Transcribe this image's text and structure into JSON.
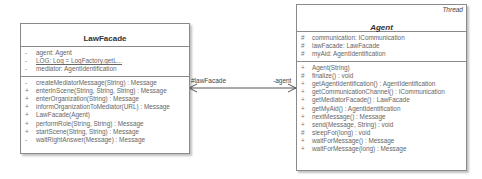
{
  "classes": {
    "lawfacade": {
      "name": "LawFacade",
      "attributes": [
        {
          "vis": "-",
          "text": "agent: Agent",
          "static": false
        },
        {
          "vis": "-",
          "text": "LOG: Log = LogFactory.getL...",
          "static": true
        },
        {
          "vis": "-",
          "text": "mediator: AgentIdentification",
          "static": false
        }
      ],
      "operations": [
        {
          "vis": "-",
          "text": "createMediatorMessage(String) : Message"
        },
        {
          "vis": "+",
          "text": "enterInScene(String, String, String) : Message"
        },
        {
          "vis": "+",
          "text": "enterOrganization(String) : Message"
        },
        {
          "vis": "+",
          "text": "informOrganizationToMediator(URL) : Message"
        },
        {
          "vis": "+",
          "text": "LawFacade(Agent)"
        },
        {
          "vis": "+",
          "text": "performRole(String, String) : Message"
        },
        {
          "vis": "+",
          "text": "startScene(String, String) : Message"
        },
        {
          "vis": "-",
          "text": "waitRightAnswer(Message) : Message"
        }
      ]
    },
    "agent": {
      "name": "Agent",
      "stereotype": "Thread",
      "attributes": [
        {
          "vis": "#",
          "text": "communication: ICommunication"
        },
        {
          "vis": "#",
          "text": "lawFacade: LawFacade"
        },
        {
          "vis": "#",
          "text": "myAid: AgentIdentification"
        }
      ],
      "operations": [
        {
          "vis": "+",
          "text": "Agent(String)"
        },
        {
          "vis": "#",
          "text": "finalize() : void"
        },
        {
          "vis": "+",
          "text": "getAgentIdentification() : AgentIdentification"
        },
        {
          "vis": "+",
          "text": "getCommunicationChannel() : ICommunication"
        },
        {
          "vis": "+",
          "text": "getMediatorFacade() : LawFacade"
        },
        {
          "vis": "+",
          "text": "getMyAid() : AgentIdentification"
        },
        {
          "vis": "+",
          "text": "nextMessage() : Message"
        },
        {
          "vis": "+",
          "text": "send(Message, String) : void"
        },
        {
          "vis": "#",
          "text": "sleepFor(long) : void"
        },
        {
          "vis": "+",
          "text": "waitForMessage() : Message"
        },
        {
          "vis": "+",
          "text": "waitForMessage(long) : Message"
        }
      ]
    }
  },
  "association": {
    "left_role": "#lawFacade",
    "right_role": "-agent"
  },
  "colors": {
    "border": "#8a8a8a",
    "text": "#666666",
    "line": "#555555"
  }
}
